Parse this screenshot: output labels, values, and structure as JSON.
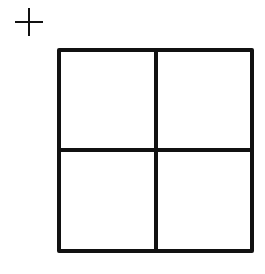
{
  "diagram": {
    "title": "",
    "background": "#ffffff",
    "stroke_color": "#111111",
    "plus_marker": {
      "cx": 29,
      "cy": 22,
      "half_length": 14,
      "stroke_width": 2
    },
    "grid": {
      "x": 59,
      "y": 50,
      "width": 193,
      "height": 201,
      "rows": 2,
      "cols": 2,
      "divider_x": 156,
      "divider_y": 150,
      "stroke_width": 4
    }
  }
}
